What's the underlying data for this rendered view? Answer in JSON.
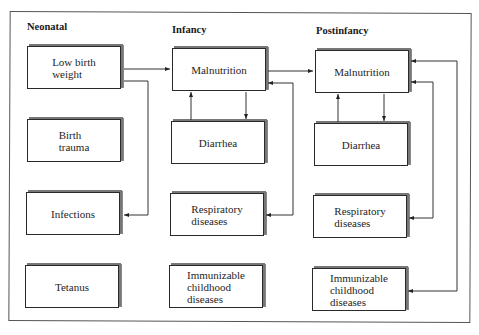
{
  "diagram": {
    "columns": [
      {
        "title": "Neonatal",
        "boxes": [
          {
            "label": "Low birth\nweight"
          },
          {
            "label": "Birth\ntrauma"
          },
          {
            "label": "Infections"
          },
          {
            "label": "Tetanus"
          }
        ]
      },
      {
        "title": "Infancy",
        "boxes": [
          {
            "label": "Malnutrition"
          },
          {
            "label": "Diarrhea"
          },
          {
            "label": "Respiratory\ndiseases"
          },
          {
            "label": "Immunizable\nchildhood\ndiseases"
          }
        ]
      },
      {
        "title": "Postinfancy",
        "boxes": [
          {
            "label": "Malnutrition"
          },
          {
            "label": "Diarrhea"
          },
          {
            "label": "Respiratory\ndiseases"
          },
          {
            "label": "Immunizable\nchildhood\ndiseases"
          }
        ]
      }
    ],
    "edges": [
      {
        "from": "Neonatal: Low birth weight",
        "to": "Infancy: Malnutrition"
      },
      {
        "from": "Neonatal: Low birth weight",
        "to": "Neonatal: Infections"
      },
      {
        "from": "Infancy: Malnutrition",
        "to": "Postinfancy: Malnutrition"
      },
      {
        "from": "Infancy: Diarrhea",
        "to": "Infancy: Malnutrition"
      },
      {
        "from": "Infancy: Malnutrition",
        "to": "Infancy: Diarrhea"
      },
      {
        "from": "Infancy: Respiratory diseases",
        "to": "Infancy: Malnutrition"
      },
      {
        "from": "Postinfancy: Diarrhea",
        "to": "Postinfancy: Malnutrition"
      },
      {
        "from": "Postinfancy: Malnutrition",
        "to": "Postinfancy: Diarrhea"
      },
      {
        "from": "Postinfancy: Respiratory diseases",
        "to": "Postinfancy: Malnutrition"
      },
      {
        "from": "Postinfancy: Immunizable childhood diseases",
        "to": "Postinfancy: Malnutrition"
      }
    ]
  }
}
